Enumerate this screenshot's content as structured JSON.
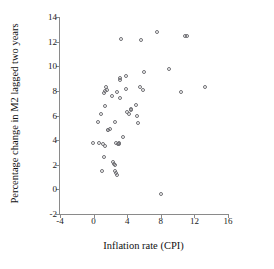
{
  "chart_data": {
    "type": "scatter",
    "title": "",
    "xlabel": "Inflation rate (CPI)",
    "ylabel": "Percentage change in M2 lagged two years",
    "xlim": [
      -4,
      16
    ],
    "ylim": [
      -2,
      14
    ],
    "xticks": [
      -4,
      0,
      4,
      8,
      12,
      16
    ],
    "yticks": [
      -2,
      0,
      2,
      4,
      6,
      8,
      10,
      12,
      14
    ],
    "xticklabels": [
      "-4",
      "0",
      "4",
      "8",
      "12",
      "16"
    ],
    "yticklabels": [
      "-2",
      "0",
      "2",
      "4",
      "6",
      "8",
      "10",
      "12",
      "14"
    ],
    "grid": false,
    "legend": null,
    "marker": "open-circle",
    "marker_color": "#6f6f74",
    "series": [
      {
        "name": "country observations",
        "points": [
          [
            -0.1,
            3.8
          ],
          [
            0.5,
            5.5
          ],
          [
            0.7,
            3.8
          ],
          [
            0.9,
            6.1
          ],
          [
            1.0,
            1.5
          ],
          [
            1.1,
            3.7
          ],
          [
            1.2,
            7.8
          ],
          [
            1.2,
            2.65
          ],
          [
            1.3,
            3.5
          ],
          [
            1.4,
            8.0
          ],
          [
            1.4,
            6.8
          ],
          [
            1.5,
            8.35
          ],
          [
            1.6,
            8.05
          ],
          [
            1.7,
            4.85
          ],
          [
            1.75,
            4.8
          ],
          [
            1.9,
            4.9
          ],
          [
            2.2,
            7.55
          ],
          [
            2.3,
            2.2
          ],
          [
            2.4,
            2.1
          ],
          [
            2.5,
            1.95
          ],
          [
            2.6,
            5.5
          ],
          [
            2.6,
            1.5
          ],
          [
            2.7,
            3.75
          ],
          [
            2.7,
            1.35
          ],
          [
            2.75,
            7.9
          ],
          [
            2.8,
            1.2
          ],
          [
            2.85,
            3.7
          ],
          [
            3.0,
            3.8
          ],
          [
            3.05,
            3.65
          ],
          [
            3.1,
            9.05
          ],
          [
            3.15,
            7.45
          ],
          [
            3.2,
            8.9
          ],
          [
            3.3,
            12.25
          ],
          [
            3.5,
            4.25
          ],
          [
            3.8,
            8.15
          ],
          [
            3.9,
            9.2
          ],
          [
            4.0,
            6.3
          ],
          [
            4.2,
            6.15
          ],
          [
            4.4,
            6.5
          ],
          [
            4.5,
            6.45
          ],
          [
            5.0,
            6.85
          ],
          [
            5.2,
            5.95
          ],
          [
            5.3,
            5.4
          ],
          [
            5.5,
            8.3
          ],
          [
            5.6,
            12.1
          ],
          [
            5.9,
            8.1
          ],
          [
            6.0,
            9.5
          ],
          [
            7.6,
            12.8
          ],
          [
            8.0,
            -0.4
          ],
          [
            9.0,
            9.75
          ],
          [
            10.4,
            7.9
          ],
          [
            10.9,
            12.45
          ],
          [
            11.1,
            12.45
          ],
          [
            13.3,
            8.35
          ]
        ]
      }
    ]
  }
}
